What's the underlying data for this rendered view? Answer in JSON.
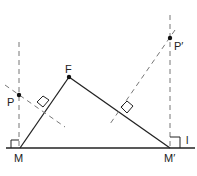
{
  "diagram": {
    "type": "geometry-reflection",
    "points": {
      "M": {
        "label": "M",
        "x": 20,
        "y": 148
      },
      "M_prime": {
        "label": "M′",
        "x": 170,
        "y": 148
      },
      "F": {
        "label": "F",
        "x": 69,
        "y": 77
      },
      "P": {
        "label": "P",
        "x": 19,
        "y": 95
      },
      "P_prime": {
        "label": "P′",
        "x": 170,
        "y": 38
      }
    },
    "line_label": "l",
    "colors": {
      "stroke": "#222222",
      "dash": "#777777"
    }
  }
}
